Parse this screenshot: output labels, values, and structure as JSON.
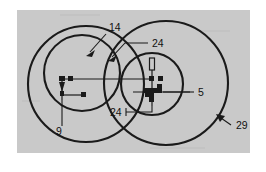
{
  "figure": {
    "kind": "patent-line-drawing",
    "panel": {
      "background_color": "#c9c9c9",
      "page_color": "#ffffff",
      "x": 17,
      "y": 10,
      "width": 233,
      "height": 143
    },
    "line_color": "#1a1a1a",
    "reference_labels": [
      {
        "id": "ref-14",
        "text": "14",
        "x": 109,
        "y": 31,
        "points_to": "large-left-circle-top",
        "leader": "diagonal-arrow-down-left"
      },
      {
        "id": "ref-24-top",
        "text": "24",
        "x": 152,
        "y": 44,
        "points_to": "circle-intersection-upper",
        "leader": "horizontal-then-diagonal-arrow"
      },
      {
        "id": "ref-24-bottom",
        "text": "24",
        "x": 116,
        "y": 114,
        "points_to": "small-right-circle-center-axis",
        "leader": "horizontal-then-vertical"
      },
      {
        "id": "ref-5",
        "text": "5",
        "x": 198,
        "y": 92,
        "points_to": "small-right-circle-internal-part",
        "leader": "horizontal"
      },
      {
        "id": "ref-9",
        "text": "9",
        "x": 59,
        "y": 132,
        "points_to": "left-circle-internal-part",
        "leader": "vertical"
      },
      {
        "id": "ref-29",
        "text": "29",
        "x": 236,
        "y": 126,
        "points_to": "large-right-circle-edge",
        "leader": "diagonal-arrow-up-left"
      }
    ],
    "circles": [
      {
        "id": "large-left-circle",
        "cx": 86,
        "cy": 84,
        "r": 58
      },
      {
        "id": "small-left-circle",
        "cx": 82,
        "cy": 73,
        "r": 38
      },
      {
        "id": "large-right-circle",
        "cx": 166,
        "cy": 83,
        "r": 62
      },
      {
        "id": "small-right-circle",
        "cx": 152,
        "cy": 84,
        "r": 31
      }
    ]
  }
}
